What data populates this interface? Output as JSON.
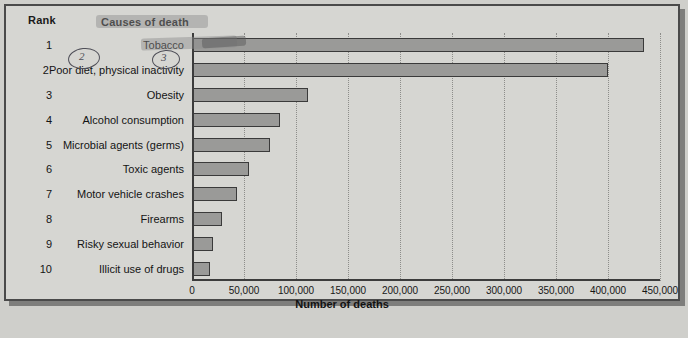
{
  "chart_data": {
    "type": "bar",
    "orientation": "horizontal",
    "title": "",
    "xlabel": "Number of deaths",
    "ylabel": "",
    "xlim": [
      0,
      450000
    ],
    "xticks": [
      "0",
      "50,000",
      "100,000",
      "150,000",
      "200,000",
      "250,000",
      "300,000",
      "350,000",
      "400,000",
      "450,000"
    ],
    "xtick_values": [
      0,
      50000,
      100000,
      150000,
      200000,
      250000,
      300000,
      350000,
      400000,
      450000
    ],
    "grid": "vertical-dotted",
    "legend": "none",
    "categories": [
      "Tobacco",
      "Poor diet, physical inactivity",
      "Obesity",
      "Alcohol consumption",
      "Microbial agents (germs)",
      "Toxic agents",
      "Motor vehicle crashes",
      "Firearms",
      "Risky sexual behavior",
      "Illicit use of drugs"
    ],
    "values": [
      435000,
      400000,
      112000,
      85000,
      75000,
      55000,
      43000,
      29000,
      20000,
      17000
    ],
    "ranks": [
      "1",
      "2",
      "3",
      "4",
      "5",
      "6",
      "7",
      "8",
      "9",
      "10"
    ],
    "bar_color": "#9a9a98",
    "bar_edge_color": "#3a3a3a",
    "background_color": "#d6d6d2"
  },
  "headers": {
    "rank": "Rank",
    "causes": "Causes of death"
  },
  "annotations": {
    "circled_2": "2",
    "circled_3": "3",
    "highlight_title": "Causes of death",
    "highlight_row1": "Tobacco"
  }
}
